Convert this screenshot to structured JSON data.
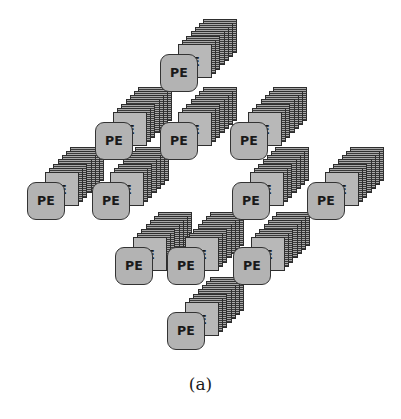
{
  "figure": {
    "caption": "(a)",
    "background_color": "#ffffff",
    "node_count": 13,
    "layers_per_stack": 7,
    "node_labels": {
      "processor": "PE",
      "memory": "CE"
    },
    "colors": {
      "node_fill": "#b3b3b3",
      "node_border": "#2e2e2e",
      "stack_hatch_dark": "#3a3a3a",
      "stack_hatch_light": "#a8a8a8",
      "text": "#1a1a1a"
    },
    "nodes": [
      {
        "id": "n1",
        "pe": "PE",
        "ce": "CE",
        "x": 160,
        "y": 22
      },
      {
        "id": "n2",
        "pe": "PE",
        "ce": "CE",
        "x": 95,
        "y": 90
      },
      {
        "id": "n3",
        "pe": "PE",
        "ce": "CE",
        "x": 160,
        "y": 90
      },
      {
        "id": "n4",
        "pe": "PE",
        "ce": "CE",
        "x": 230,
        "y": 90
      },
      {
        "id": "n5",
        "pe": "PE",
        "ce": "CE",
        "x": 27,
        "y": 150
      },
      {
        "id": "n6",
        "pe": "PE",
        "ce": "CE",
        "x": 92,
        "y": 150
      },
      {
        "id": "n7",
        "pe": "PE",
        "ce": "CE",
        "x": 232,
        "y": 150
      },
      {
        "id": "n8",
        "pe": "PE",
        "ce": "CE",
        "x": 307,
        "y": 150
      },
      {
        "id": "n9",
        "pe": "PE",
        "ce": "CE",
        "x": 115,
        "y": 215
      },
      {
        "id": "n10",
        "pe": "PE",
        "ce": "CE",
        "x": 167,
        "y": 215
      },
      {
        "id": "n11",
        "pe": "PE",
        "ce": "CE",
        "x": 233,
        "y": 215
      },
      {
        "id": "n12",
        "pe": "PE",
        "ce": "CE",
        "x": 167,
        "y": 280
      },
      {
        "id": "n13",
        "pe": "PE",
        "ce": "CE",
        "x": 115,
        "y": 215
      }
    ]
  }
}
